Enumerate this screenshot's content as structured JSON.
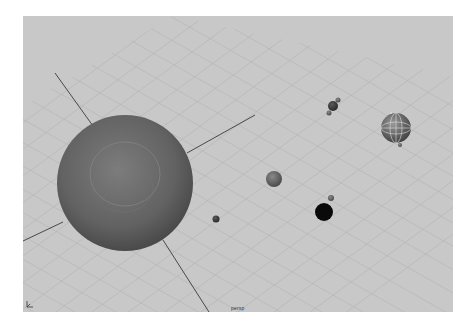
{
  "app": {
    "type": "3d-viewport",
    "camera_label": "persp"
  },
  "viewport": {
    "background": "#c8c8c8",
    "grid_color": "#b6b6b6",
    "axis_color": "#3a3a3a"
  },
  "objects": [
    {
      "name": "sun",
      "cx": 102,
      "cy": 167,
      "r": 68,
      "color": "#6a6a6a",
      "selected": false
    },
    {
      "name": "planet-mid",
      "cx": 251,
      "cy": 163,
      "r": 8,
      "color": "#707070",
      "selected": false
    },
    {
      "name": "planet-small",
      "cx": 193,
      "cy": 203,
      "r": 3.5,
      "color": "#505050",
      "selected": false
    },
    {
      "name": "planet-black",
      "cx": 301,
      "cy": 196,
      "r": 9,
      "color": "#0a0a0a",
      "selected": false
    },
    {
      "name": "moon-black",
      "cx": 308,
      "cy": 182,
      "r": 3,
      "color": "#6e6e6e",
      "selected": false
    },
    {
      "name": "planet-twin",
      "cx": 310,
      "cy": 90,
      "r": 5,
      "color": "#4a4a4a",
      "selected": false
    },
    {
      "name": "planet-selected",
      "cx": 373,
      "cy": 112,
      "r": 15,
      "color": "#7a7a7a",
      "selected": true
    }
  ]
}
